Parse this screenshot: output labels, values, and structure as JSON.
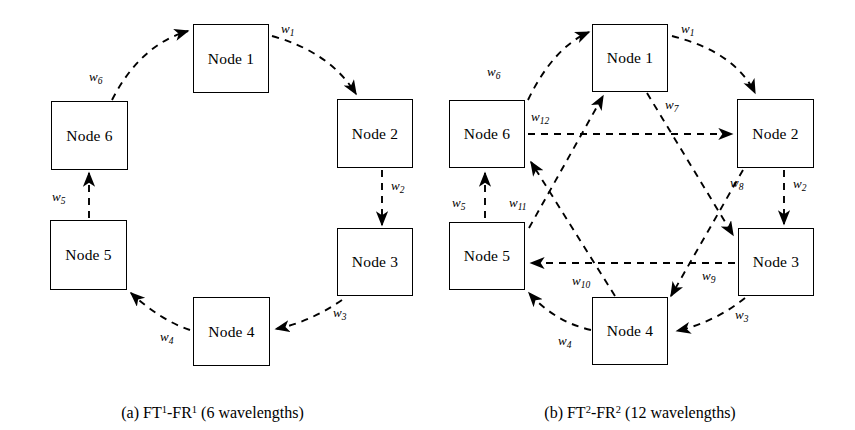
{
  "figure": {
    "background_color": "#ffffff",
    "line_color": "#000000",
    "node_label_prefix": "Node"
  },
  "panels": [
    {
      "id": "a",
      "caption_prefix": "(a)",
      "caption_text": "(a) FT1-FR1 (6 wavelengths)",
      "caption_parts": {
        "index": "(a)",
        "ft": "FT",
        "ft_sup": "1",
        "dash": "-",
        "fr": "FR",
        "fr_sup": "1",
        "tail": "(6 wavelengths)"
      },
      "wavelength_count": 6,
      "nodes": [
        {
          "id": "n1",
          "label": "Node 1"
        },
        {
          "id": "n2",
          "label": "Node 2"
        },
        {
          "id": "n3",
          "label": "Node 3"
        },
        {
          "id": "n4",
          "label": "Node 4"
        },
        {
          "id": "n5",
          "label": "Node 5"
        },
        {
          "id": "n6",
          "label": "Node 6"
        }
      ],
      "edges": [
        {
          "id": "e1",
          "label": "w",
          "sub": "1",
          "from": "Node 1",
          "to": "Node 2"
        },
        {
          "id": "e2",
          "label": "w",
          "sub": "2",
          "from": "Node 2",
          "to": "Node 3"
        },
        {
          "id": "e3",
          "label": "w",
          "sub": "3",
          "from": "Node 3",
          "to": "Node 4"
        },
        {
          "id": "e4",
          "label": "w",
          "sub": "4",
          "from": "Node 4",
          "to": "Node 5"
        },
        {
          "id": "e5",
          "label": "w",
          "sub": "5",
          "from": "Node 5",
          "to": "Node 6"
        },
        {
          "id": "e6",
          "label": "w",
          "sub": "6",
          "from": "Node 6",
          "to": "Node 1"
        }
      ]
    },
    {
      "id": "b",
      "caption_prefix": "(b)",
      "caption_text": "(b) FT2-FR2 (12 wavelengths)",
      "caption_parts": {
        "index": "(b)",
        "ft": "FT",
        "ft_sup": "2",
        "dash": "-",
        "fr": "FR",
        "fr_sup": "2",
        "tail": "(12 wavelengths)"
      },
      "wavelength_count": 12,
      "nodes": [
        {
          "id": "n1",
          "label": "Node 1"
        },
        {
          "id": "n2",
          "label": "Node 2"
        },
        {
          "id": "n3",
          "label": "Node 3"
        },
        {
          "id": "n4",
          "label": "Node 4"
        },
        {
          "id": "n5",
          "label": "Node 5"
        },
        {
          "id": "n6",
          "label": "Node 6"
        }
      ],
      "edges": [
        {
          "id": "e1",
          "label": "w",
          "sub": "1",
          "from": "Node 1",
          "to": "Node 2"
        },
        {
          "id": "e2",
          "label": "w",
          "sub": "2",
          "from": "Node 2",
          "to": "Node 3"
        },
        {
          "id": "e3",
          "label": "w",
          "sub": "3",
          "from": "Node 3",
          "to": "Node 4"
        },
        {
          "id": "e4",
          "label": "w",
          "sub": "4",
          "from": "Node 4",
          "to": "Node 5"
        },
        {
          "id": "e5",
          "label": "w",
          "sub": "5",
          "from": "Node 5",
          "to": "Node 6"
        },
        {
          "id": "e6",
          "label": "w",
          "sub": "6",
          "from": "Node 6",
          "to": "Node 1"
        },
        {
          "id": "e7",
          "label": "w",
          "sub": "7",
          "from": "Node 1",
          "to": "Node 3"
        },
        {
          "id": "e8",
          "label": "w",
          "sub": "8",
          "from": "Node 2",
          "to": "Node 4"
        },
        {
          "id": "e9",
          "label": "w",
          "sub": "9",
          "from": "Node 3",
          "to": "Node 5"
        },
        {
          "id": "e10",
          "label": "w",
          "sub": "10",
          "from": "Node 4",
          "to": "Node 6"
        },
        {
          "id": "e11",
          "label": "w",
          "sub": "11",
          "from": "Node 5",
          "to": "Node 1"
        },
        {
          "id": "e12",
          "label": "w",
          "sub": "12",
          "from": "Node 6",
          "to": "Node 2"
        }
      ]
    }
  ]
}
